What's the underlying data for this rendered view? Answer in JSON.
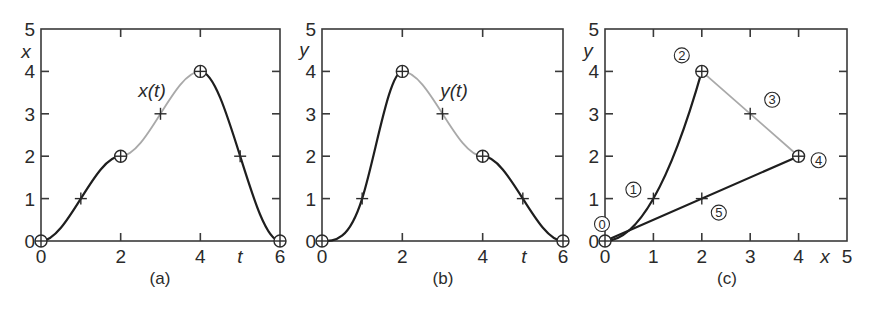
{
  "chart_data": [
    {
      "id": "a",
      "type": "line",
      "caption": "(a)",
      "curve_label": "x(t)",
      "xlabel": "t",
      "ylabel": "x",
      "xlim": [
        0,
        6
      ],
      "ylim": [
        0,
        5
      ],
      "xticks": [
        0,
        2,
        4,
        6
      ],
      "yticks": [
        0,
        1,
        2,
        3,
        4,
        5
      ],
      "grid": false,
      "key_points": [
        {
          "t": 0,
          "value": 0
        },
        {
          "t": 2,
          "value": 2
        },
        {
          "t": 4,
          "value": 4
        },
        {
          "t": 6,
          "value": 0
        }
      ],
      "intermediate_points": [
        {
          "t": 1,
          "value": 1
        },
        {
          "t": 3,
          "value": 3
        },
        {
          "t": 5,
          "value": 2
        }
      ],
      "segments": [
        {
          "from_t": 0,
          "to_t": 2,
          "style": "dark"
        },
        {
          "from_t": 2,
          "to_t": 4,
          "style": "light"
        },
        {
          "from_t": 4,
          "to_t": 6,
          "style": "dark"
        }
      ],
      "curve_label_at": {
        "t": 2.9,
        "value": 3.55
      }
    },
    {
      "id": "b",
      "type": "line",
      "caption": "(b)",
      "curve_label": "y(t)",
      "xlabel": "t",
      "ylabel": "y",
      "xlim": [
        0,
        6
      ],
      "ylim": [
        0,
        5
      ],
      "xticks": [
        0,
        2,
        4,
        6
      ],
      "yticks": [
        0,
        1,
        2,
        3,
        4,
        5
      ],
      "grid": false,
      "key_points": [
        {
          "t": 0,
          "value": 0
        },
        {
          "t": 2,
          "value": 4
        },
        {
          "t": 4,
          "value": 2
        },
        {
          "t": 6,
          "value": 0
        }
      ],
      "intermediate_points": [
        {
          "t": 1,
          "value": 1
        },
        {
          "t": 3,
          "value": 3
        },
        {
          "t": 5,
          "value": 1
        }
      ],
      "segments": [
        {
          "from_t": 0,
          "to_t": 2,
          "style": "dark"
        },
        {
          "from_t": 2,
          "to_t": 4,
          "style": "light"
        },
        {
          "from_t": 4,
          "to_t": 6,
          "style": "dark"
        }
      ],
      "curve_label_at": {
        "t": 2.55,
        "value": 3.55
      }
    },
    {
      "id": "c",
      "type": "line",
      "caption": "(c)",
      "xlabel": "x",
      "ylabel": "y",
      "xlim": [
        0,
        5
      ],
      "ylim": [
        0,
        5
      ],
      "xticks": [
        0,
        1,
        2,
        3,
        4,
        5
      ],
      "yticks": [
        0,
        1,
        2,
        3,
        4,
        5
      ],
      "grid": false,
      "key_points": [
        {
          "x": 0,
          "y": 0,
          "label": "0"
        },
        {
          "x": 2,
          "y": 4,
          "label": "2"
        },
        {
          "x": 4,
          "y": 2,
          "label": "4"
        }
      ],
      "intermediate_points": [
        {
          "x": 1,
          "y": 1,
          "label": "1"
        },
        {
          "x": 3,
          "y": 3,
          "label": "3"
        },
        {
          "x": 2,
          "y": 1,
          "label": "5"
        }
      ],
      "segments": [
        {
          "from": 0,
          "to": 2,
          "style": "dark",
          "shape": "curve"
        },
        {
          "from": 2,
          "to": 4,
          "style": "light",
          "shape": "straight"
        },
        {
          "from": 4,
          "to": 0,
          "style": "dark",
          "shape": "straight"
        }
      ]
    }
  ]
}
